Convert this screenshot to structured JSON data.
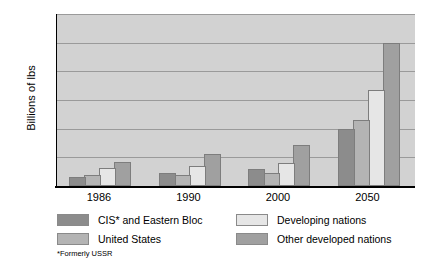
{
  "chart_data": {
    "type": "bar",
    "title": "",
    "xlabel": "",
    "ylabel": "Billions of lbs",
    "ylim": [
      0,
      6
    ],
    "yticks": [
      "0",
      "1",
      "2",
      "3",
      "4",
      "5",
      "6"
    ],
    "grid": true,
    "legend_position": "bottom",
    "categories": [
      "1986",
      "1990",
      "2000",
      "2050"
    ],
    "series": [
      {
        "name": "CIS* and Eastern Bloc",
        "color": "#8c8c8c",
        "values": [
          0.33,
          0.45,
          0.58,
          2.0
        ]
      },
      {
        "name": "United States",
        "color": "#b4b4b4",
        "values": [
          0.4,
          0.38,
          0.45,
          2.3
        ]
      },
      {
        "name": "Developing nations",
        "color": "#e6e6e6",
        "values": [
          0.62,
          0.7,
          0.82,
          3.35
        ]
      },
      {
        "name": "Other developed nations",
        "color": "#a0a0a0",
        "values": [
          0.85,
          1.1,
          1.42,
          5.0
        ]
      }
    ],
    "footnote": "*Formerly USSR"
  }
}
